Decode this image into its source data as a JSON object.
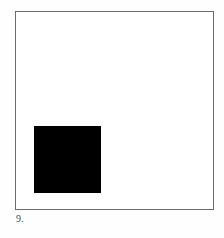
{
  "plate": {
    "figure_number": "9.",
    "background_color": "#ffffff"
  },
  "frame": {
    "border_color": "#6b6b6b",
    "fill_color": "#ffffff",
    "border_width_px": 1,
    "x": 15,
    "y": 11,
    "width": 199,
    "height": 199
  },
  "shapes": [
    {
      "name": "black-square",
      "kind": "square",
      "fill_color": "#000000",
      "x": 34,
      "y": 126,
      "width": 67,
      "height": 67,
      "position_note": "lower-left"
    }
  ],
  "caption": {
    "text": "9.",
    "color": "#4a4a4a"
  }
}
